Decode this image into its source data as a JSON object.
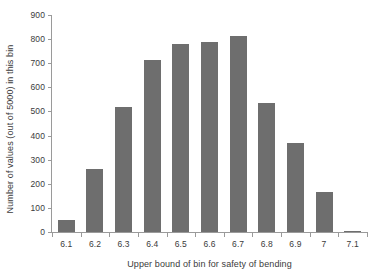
{
  "chart_data": {
    "type": "bar",
    "title": "",
    "subtitle": "",
    "xlabel": "Upper bound of bin for safety of bending",
    "ylabel": "Number of values (out of 5000) in this bin",
    "categories": [
      "6.1",
      "6.2",
      "6.3",
      "6.4",
      "6.5",
      "6.6",
      "6.7",
      "6.8",
      "6.9",
      "7",
      "7.1"
    ],
    "values": [
      50,
      262,
      518,
      715,
      780,
      787,
      815,
      537,
      368,
      168,
      5
    ],
    "ylim": [
      0,
      900
    ],
    "ytick_labels": [
      "0",
      "100",
      "200",
      "300",
      "400",
      "500",
      "600",
      "700",
      "800",
      "900"
    ],
    "ytick_values": [
      0,
      100,
      200,
      300,
      400,
      500,
      600,
      700,
      800,
      900
    ],
    "ytick_interval": 100,
    "grid": false,
    "legend": false,
    "legend_position": "none",
    "bar_color": "#6e6e6e",
    "axis_color": "#9a9a9a",
    "text_color": "#3b3b3b",
    "background_color": "#ffffff"
  }
}
